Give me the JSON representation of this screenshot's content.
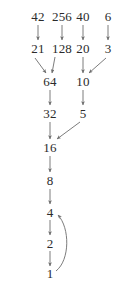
{
  "graph": {
    "title": "Collatz sequence convergence diagram",
    "text_color": "#2b2b2b",
    "edge_color": "#6d6d6d",
    "background": "#ffffff",
    "nodes": [
      {
        "id": "n42",
        "label": "42",
        "x": 38,
        "y": 16
      },
      {
        "id": "n256",
        "label": "256",
        "x": 62,
        "y": 16
      },
      {
        "id": "n40",
        "label": "40",
        "x": 83,
        "y": 16
      },
      {
        "id": "n6",
        "label": "6",
        "x": 108,
        "y": 16
      },
      {
        "id": "n21",
        "label": "21",
        "x": 38,
        "y": 48
      },
      {
        "id": "n128",
        "label": "128",
        "x": 62,
        "y": 48
      },
      {
        "id": "n20",
        "label": "20",
        "x": 83,
        "y": 48
      },
      {
        "id": "n3",
        "label": "3",
        "x": 108,
        "y": 48
      },
      {
        "id": "n64",
        "label": "64",
        "x": 50,
        "y": 81
      },
      {
        "id": "n10",
        "label": "10",
        "x": 83,
        "y": 81
      },
      {
        "id": "n32",
        "label": "32",
        "x": 50,
        "y": 113
      },
      {
        "id": "n5",
        "label": "5",
        "x": 83,
        "y": 113
      },
      {
        "id": "n16",
        "label": "16",
        "x": 50,
        "y": 147
      },
      {
        "id": "n8",
        "label": "8",
        "x": 50,
        "y": 180
      },
      {
        "id": "n4",
        "label": "4",
        "x": 50,
        "y": 212
      },
      {
        "id": "n2",
        "label": "2",
        "x": 50,
        "y": 243
      },
      {
        "id": "n1",
        "label": "1",
        "x": 50,
        "y": 273
      }
    ],
    "edges": [
      {
        "id": "e-42-21",
        "from": "42",
        "to": "21",
        "kind": "straight",
        "x1": 38,
        "y1": 25,
        "x2": 38,
        "y2": 40
      },
      {
        "id": "e-256-128",
        "from": "256",
        "to": "128",
        "kind": "straight",
        "x1": 62,
        "y1": 25,
        "x2": 62,
        "y2": 40
      },
      {
        "id": "e-40-20",
        "from": "40",
        "to": "20",
        "kind": "straight",
        "x1": 83,
        "y1": 25,
        "x2": 83,
        "y2": 40
      },
      {
        "id": "e-6-3",
        "from": "6",
        "to": "3",
        "kind": "straight",
        "x1": 108,
        "y1": 25,
        "x2": 108,
        "y2": 40
      },
      {
        "id": "e-21-64",
        "from": "21",
        "to": "64",
        "kind": "straight",
        "x1": 35,
        "y1": 58,
        "x2": 46,
        "y2": 73
      },
      {
        "id": "e-128-64",
        "from": "128",
        "to": "64",
        "kind": "straight",
        "x1": 55,
        "y1": 57,
        "x2": 52,
        "y2": 73
      },
      {
        "id": "e-20-10",
        "from": "20",
        "to": "10",
        "kind": "straight",
        "x1": 83,
        "y1": 57,
        "x2": 83,
        "y2": 73
      },
      {
        "id": "e-3-10",
        "from": "3",
        "to": "10",
        "kind": "straight",
        "x1": 106,
        "y1": 58,
        "x2": 89,
        "y2": 73
      },
      {
        "id": "e-64-32",
        "from": "64",
        "to": "32",
        "kind": "straight",
        "x1": 50,
        "y1": 90,
        "x2": 50,
        "y2": 105
      },
      {
        "id": "e-10-5",
        "from": "10",
        "to": "5",
        "kind": "straight",
        "x1": 83,
        "y1": 90,
        "x2": 83,
        "y2": 105
      },
      {
        "id": "e-32-16",
        "from": "32",
        "to": "16",
        "kind": "straight",
        "x1": 50,
        "y1": 122,
        "x2": 50,
        "y2": 139
      },
      {
        "id": "e-5-16",
        "from": "5",
        "to": "16",
        "kind": "straight",
        "x1": 80,
        "y1": 122,
        "x2": 57,
        "y2": 139
      },
      {
        "id": "e-16-8",
        "from": "16",
        "to": "8",
        "kind": "straight",
        "x1": 50,
        "y1": 156,
        "x2": 50,
        "y2": 172
      },
      {
        "id": "e-8-4",
        "from": "8",
        "to": "4",
        "kind": "straight",
        "x1": 50,
        "y1": 189,
        "x2": 50,
        "y2": 204
      },
      {
        "id": "e-4-2",
        "from": "4",
        "to": "2",
        "kind": "straight",
        "x1": 50,
        "y1": 220,
        "x2": 50,
        "y2": 235
      },
      {
        "id": "e-2-1",
        "from": "2",
        "to": "1",
        "kind": "straight",
        "x1": 50,
        "y1": 251,
        "x2": 50,
        "y2": 266
      },
      {
        "id": "e-1-4",
        "from": "1",
        "to": "4",
        "kind": "curved",
        "path": "M 56 271 C 70 260, 70 228, 58 215"
      }
    ]
  }
}
